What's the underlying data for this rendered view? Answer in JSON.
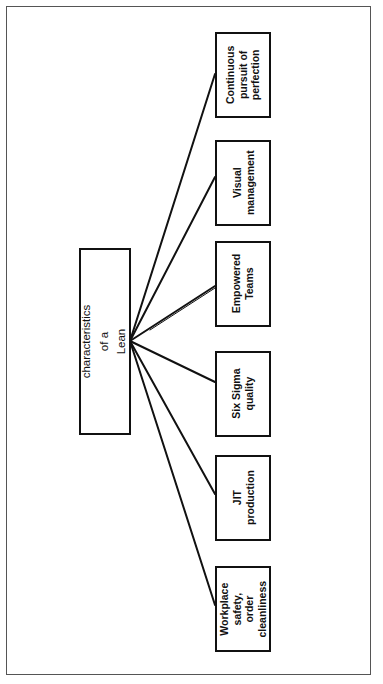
{
  "diagram": {
    "type": "tree",
    "orientation": "rotated-90-ccw",
    "root": {
      "label": "Six characteristics of a\nLean Enterprise"
    },
    "children": [
      {
        "label": "Continuous\npursuit of\nperfection"
      },
      {
        "label": "Visual\nmanagement"
      },
      {
        "label": "Empowered\nTeams"
      },
      {
        "label": "Six Sigma\nquality"
      },
      {
        "label": "JIT\nproduction"
      },
      {
        "label": "Workplace\nsafety, order\ncleanliness"
      }
    ]
  },
  "colors": {
    "line": "#111111",
    "frame": "#555555",
    "background": "#ffffff"
  }
}
